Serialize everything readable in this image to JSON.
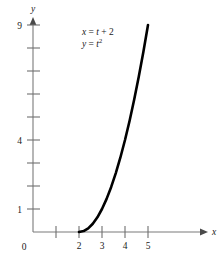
{
  "figure": {
    "background_color": "#ffffff",
    "curve_color": "#000000",
    "axis_color": "#7a7a7a"
  },
  "annotations": {
    "equation_x_lhs": "x",
    "equation_x_eq": "=",
    "equation_x_rhs_var": "t",
    "equation_x_rhs_rest": "+ 2",
    "equation_y_lhs": "y",
    "equation_y_eq": "=",
    "equation_y_rhs_var": "t",
    "equation_y_rhs_exp": "2",
    "equation_x_full": "x = t + 2",
    "equation_y_full": "y = t²"
  },
  "chart_data": {
    "type": "line",
    "title": "",
    "subtitle": "",
    "xlabel": "x",
    "ylabel": "y",
    "parametric": true,
    "parametric_equations": [
      "x = t + 2",
      "y = t^2"
    ],
    "parameter": "t",
    "parameter_range": [
      0,
      3
    ],
    "xlim": [
      0,
      6.2
    ],
    "ylim": [
      0,
      9.9
    ],
    "grid": false,
    "legend": null,
    "origin_label": "0",
    "xticks": [
      1,
      2,
      3,
      4,
      5
    ],
    "xticklabels": [
      "",
      "2",
      "3",
      "4",
      "5"
    ],
    "yticks": [
      1,
      2,
      3,
      4,
      5,
      6,
      7,
      8,
      9
    ],
    "yticklabels": [
      "1",
      "",
      "",
      "4",
      "",
      "",
      "",
      "",
      "9"
    ],
    "series": [
      {
        "name": "x = t + 2, y = t^2",
        "x": [
          2.0,
          2.2,
          2.4,
          2.6,
          2.8,
          3.0,
          3.2,
          3.4,
          3.6,
          3.8,
          4.0,
          4.2,
          4.4,
          4.6,
          4.8,
          5.0
        ],
        "y": [
          0.0,
          0.04,
          0.16,
          0.36,
          0.64,
          1.0,
          1.44,
          1.96,
          2.56,
          3.24,
          4.0,
          4.84,
          5.76,
          6.76,
          7.84,
          9.0
        ]
      }
    ]
  }
}
